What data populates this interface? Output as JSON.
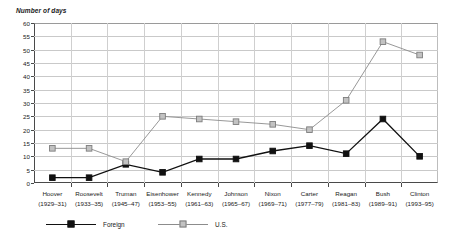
{
  "chart_data": {
    "type": "line",
    "title": "",
    "ylabel": "Number of days",
    "xlabel": "",
    "ylim": [
      0,
      60
    ],
    "ytick_step": 5,
    "yticks": [
      0,
      5,
      10,
      15,
      20,
      25,
      30,
      35,
      40,
      45,
      50,
      55,
      60
    ],
    "grid": true,
    "legend_position": "bottom",
    "categories": [
      "Hoover",
      "Roosevelt",
      "Truman",
      "Eisenhower",
      "Kennedy",
      "Johnson",
      "Nixon",
      "Carter",
      "Reagan",
      "Bush",
      "Clinton"
    ],
    "category_years": [
      "(1929–31)",
      "(1933–35)",
      "(1945–47)",
      "(1953–55)",
      "(1961–63)",
      "(1965–67)",
      "(1969–71)",
      "(1977–79)",
      "(1981–83)",
      "(1989–91)",
      "(1993–95)"
    ],
    "series": [
      {
        "name": "Foreign",
        "color": "#111111",
        "marker": "filled-square",
        "values": [
          2,
          2,
          7,
          4,
          9,
          9,
          12,
          14,
          11,
          24,
          10
        ]
      },
      {
        "name": "U.S.",
        "color": "#8c8c8c",
        "marker": "open-square",
        "values": [
          13,
          13,
          8,
          25,
          24,
          23,
          22,
          20,
          31,
          53,
          48
        ]
      }
    ]
  }
}
